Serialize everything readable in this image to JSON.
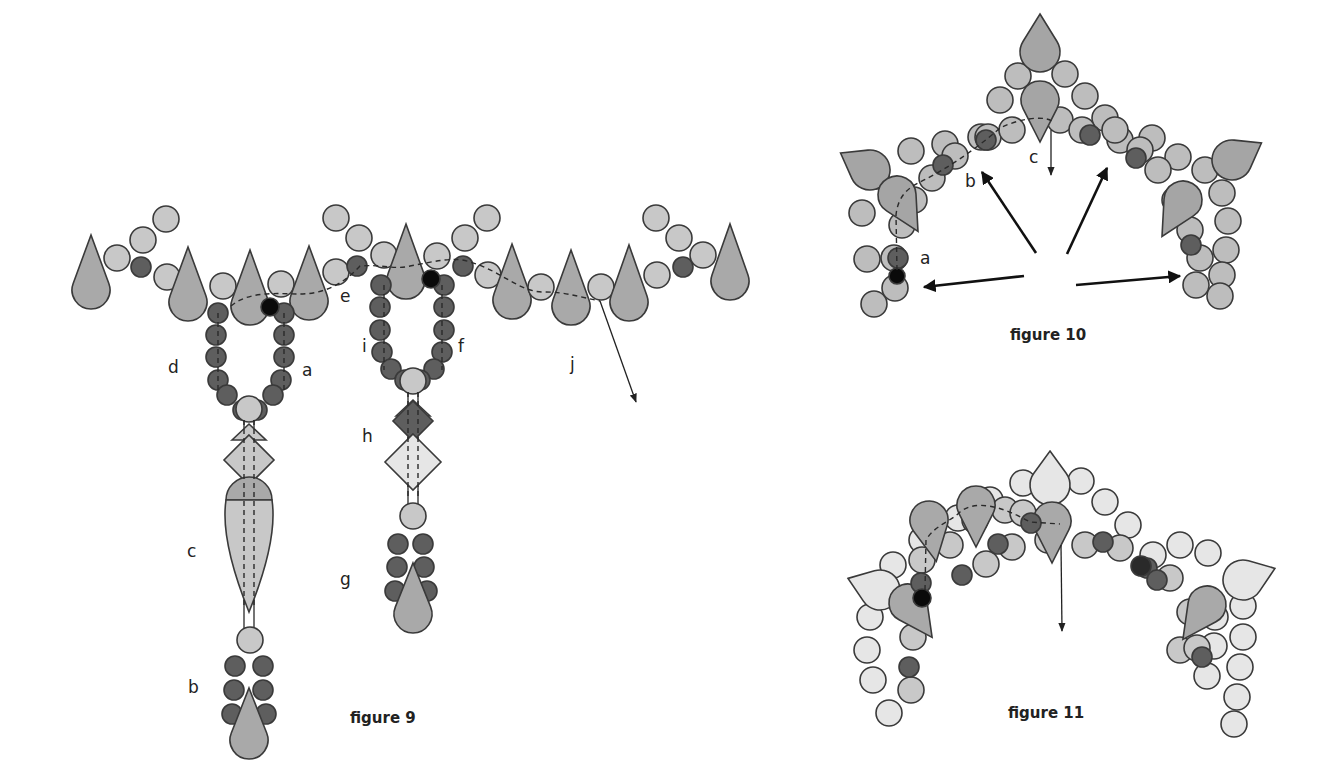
{
  "colors": {
    "light": "#c8c8c8",
    "lighter": "#e6e6e6",
    "mid": "#a9a9a9",
    "dark": "#5e5e5e",
    "black": "#0a0a0a",
    "fig10_light": "#bdbdbd",
    "fig10_mid": "#a5a5a5"
  },
  "figure9": {
    "caption": "figure 9",
    "labels": {
      "a": "a",
      "b": "b",
      "c": "c",
      "d": "d",
      "e": "e",
      "f": "f",
      "g": "g",
      "h": "h",
      "i": "i",
      "j": "j"
    }
  },
  "figure10": {
    "caption": "figure 10",
    "labels": {
      "a": "a",
      "b": "b",
      "c": "c"
    }
  },
  "figure11": {
    "caption": "figure 11"
  }
}
